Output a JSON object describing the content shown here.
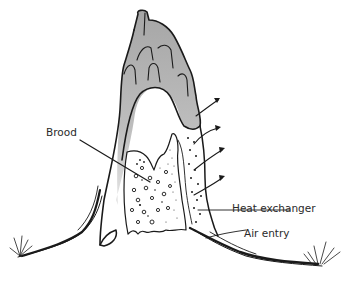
{
  "diagram": {
    "labels": {
      "brood": "Brood",
      "heat_exchanger": "Heat exchanger",
      "air_entry": "Air entry"
    },
    "colors": {
      "background": "#ffffff",
      "ink": "#1a1a1a",
      "chimney_fill_top": "#a9a9a9",
      "chimney_fill_bottom": "#e2e2e2",
      "text": "#2a2a2a"
    },
    "arrows": {
      "count": 4,
      "direction": "outward-right"
    }
  }
}
